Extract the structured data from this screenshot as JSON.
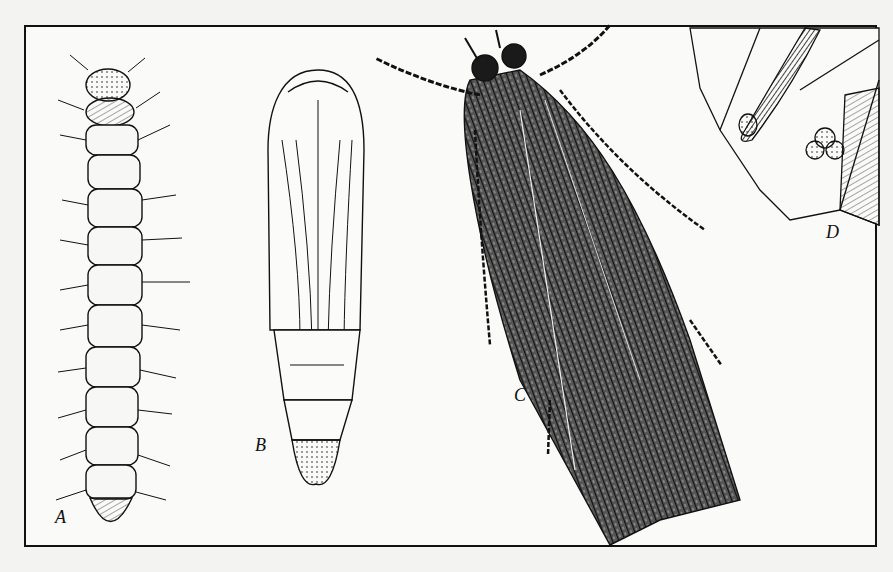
{
  "figure": {
    "labels": {
      "a": "A",
      "b": "B",
      "c": "C",
      "d": "D"
    },
    "panels": [
      {
        "id": "A",
        "subject": "larva"
      },
      {
        "id": "B",
        "subject": "pupa"
      },
      {
        "id": "C",
        "subject": "adult moth"
      },
      {
        "id": "D",
        "subject": "leaf with eggs"
      }
    ],
    "colors": {
      "ink": "#111111",
      "paper": "#fafaf8",
      "margin": "#f3f3f1"
    }
  }
}
